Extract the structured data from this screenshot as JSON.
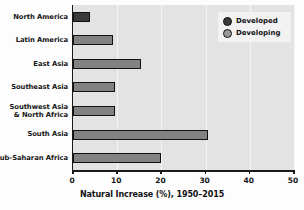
{
  "chart_data": {
    "type": "bar",
    "orientation": "horizontal",
    "title": "",
    "xlabel": "Natural Increase (%), 1950–2015",
    "ylabel": "",
    "xlim": [
      0,
      50
    ],
    "xticks": [
      0,
      10,
      20,
      30,
      40,
      50
    ],
    "xtick_labels": [
      "0",
      "10",
      "20",
      "30",
      "40",
      "50"
    ],
    "grid": true,
    "grid_axis": "x",
    "legend_position": "top-right",
    "categories": [
      "North America",
      "Latin America",
      "East Asia",
      "Southeast Asia",
      "Southwest Asia & North Africa",
      "South Asia",
      "Sub-Saharan Africa"
    ],
    "category_label_lines": [
      [
        "North America"
      ],
      [
        "Latin America"
      ],
      [
        "East Asia"
      ],
      [
        "Southeast Asia"
      ],
      [
        "Southwest Asia",
        "& North Africa"
      ],
      [
        "South Asia"
      ],
      [
        "Sub-Saharan Africa"
      ]
    ],
    "values": [
      3.8,
      9.0,
      15.4,
      9.5,
      9.5,
      30.5,
      19.9
    ],
    "point_group": [
      "Developed",
      "Developing",
      "Developing",
      "Developing",
      "Developing",
      "Developing",
      "Developing"
    ],
    "series": [
      {
        "name": "Developed",
        "color": "#3a3a3a",
        "points": [
          {
            "category": "North America",
            "value": 3.8
          }
        ]
      },
      {
        "name": "Developing",
        "color": "#828282",
        "points": [
          {
            "category": "Latin America",
            "value": 9.0
          },
          {
            "category": "East Asia",
            "value": 15.4
          },
          {
            "category": "Southeast Asia",
            "value": 9.5
          },
          {
            "category": "Southwest Asia & North Africa",
            "value": 9.5
          },
          {
            "category": "South Asia",
            "value": 30.5
          },
          {
            "category": "Sub-Saharan Africa",
            "value": 19.9
          }
        ]
      }
    ]
  },
  "legend": {
    "items": [
      {
        "label": "Developed",
        "color": "#3a3a3a"
      },
      {
        "label": "Developing",
        "color": "#9a9a9a"
      }
    ]
  },
  "colors": {
    "plot_background": "#e3e3e3",
    "page_background": "#fdfdfd",
    "axis": "#1a1a1a",
    "gridline": "#f4f4f4",
    "developed": "#3a3a3a",
    "developing": "#828282",
    "text": "#161616"
  }
}
